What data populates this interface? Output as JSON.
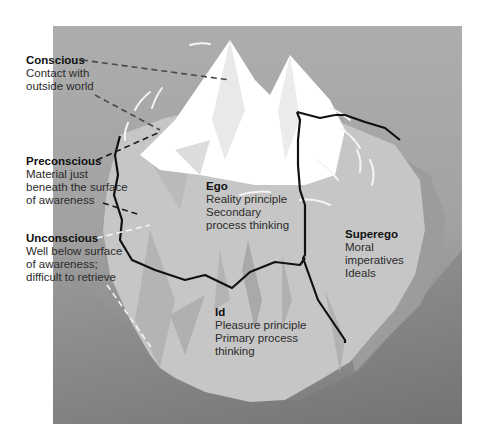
{
  "diagram": {
    "colors": {
      "background": "#ffffff",
      "panel_top": "#aaaaaa",
      "panel_bottom": "#7a7a7a",
      "iceberg_tip": "#ffffff",
      "iceberg_body": "#c4c4c4",
      "iceberg_shadow": "#a8a8a8",
      "boundary_line": "#111111",
      "leader_dark": "#444444",
      "leader_light": "#f2f2f2"
    },
    "levels": [
      {
        "id": "conscious",
        "title": "Conscious",
        "lines": [
          "Contact with",
          "outside world"
        ]
      },
      {
        "id": "preconscious",
        "title": "Preconscious",
        "lines": [
          "Material just",
          "beneath the surface",
          "of awareness"
        ]
      },
      {
        "id": "unconscious",
        "title": "Unconscious",
        "lines": [
          "Well below surface",
          "of awareness;",
          "difficult to retrieve"
        ]
      }
    ],
    "structures": [
      {
        "id": "ego",
        "title": "Ego",
        "lines": [
          "Reality principle",
          "Secondary",
          "process thinking"
        ]
      },
      {
        "id": "superego",
        "title": "Superego",
        "lines": [
          "Moral",
          "imperatives",
          "Ideals"
        ]
      },
      {
        "id": "id",
        "title": "Id",
        "lines": [
          "Pleasure principle",
          "Primary process",
          "thinking"
        ]
      }
    ]
  }
}
